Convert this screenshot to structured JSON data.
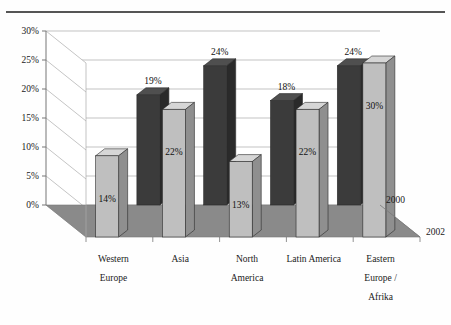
{
  "chart_data": {
    "type": "bar",
    "title": "",
    "subtitle": "",
    "xlabel": "",
    "ylabel": "",
    "zlabel": "",
    "categories": [
      "Western Europe",
      "Asia",
      "North America",
      "Latin America",
      "Eastern Europe / Afrika"
    ],
    "category_lines": [
      [
        "Western",
        "Europe"
      ],
      [
        "Asia"
      ],
      [
        "North",
        "America"
      ],
      [
        "Latin America"
      ],
      [
        "Eastern",
        "Europe /",
        "Afrika"
      ]
    ],
    "series": [
      {
        "name": "2000",
        "color": "#3b3b3b",
        "values": [
          null,
          19,
          24,
          18,
          24
        ],
        "labels": [
          "",
          "19%",
          "24%",
          "18%",
          "24%"
        ]
      },
      {
        "name": "2002",
        "color": "#bfbfbf",
        "values": [
          14,
          22,
          13,
          22,
          30
        ],
        "labels": [
          "14%",
          "22%",
          "13%",
          "22%",
          "30%"
        ]
      }
    ],
    "ylim": [
      0,
      30
    ],
    "ytick_step": 5,
    "ytick_labels": [
      "0%",
      "5%",
      "10%",
      "15%",
      "20%",
      "25%",
      "30%"
    ],
    "ytick_values": [
      0,
      5,
      10,
      15,
      20,
      25,
      30
    ],
    "grid": true,
    "legend_position": "depth-axis-right",
    "depth_axis_labels": [
      "2000",
      "2002"
    ],
    "unit": "%"
  },
  "colors": {
    "bar_2000_face": "#3b3b3b",
    "bar_2000_side": "#2a2a2a",
    "bar_2000_top": "#4f4f4f",
    "bar_2002_face": "#bfbfbf",
    "bar_2002_side": "#8f8f8f",
    "bar_2002_top": "#d6d6d6",
    "floor": "#8a8a8a",
    "back_wall": "#ffffff",
    "grid_line": "#aaaaaa",
    "axis_line": "#777777",
    "top_rule": "#555555",
    "text": "#1a1a1a"
  }
}
